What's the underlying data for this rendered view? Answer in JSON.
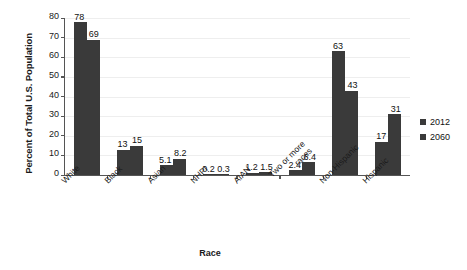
{
  "chart_data": {
    "type": "bar",
    "title": "",
    "xlabel": "Race",
    "ylabel": "Percent of Total U.S. Population",
    "ylim": [
      0,
      80
    ],
    "yticks": [
      0,
      10,
      20,
      30,
      40,
      50,
      60,
      70,
      80
    ],
    "grid": true,
    "legend_position": "right",
    "categories": [
      "White",
      "Black",
      "Asian",
      "NHPI",
      "AIAN",
      "Two or more races",
      "Non-Hispanic",
      "Hispanic"
    ],
    "series": [
      {
        "name": "2012",
        "values": [
          78,
          13,
          5.1,
          0.2,
          1.2,
          2.4,
          63,
          17
        ],
        "labels": [
          "78",
          "13",
          "5.1",
          "0.2",
          "1.2",
          "2.4",
          "63",
          "17"
        ],
        "color": "#3a3a3a"
      },
      {
        "name": "2060",
        "values": [
          69,
          15,
          8.2,
          0.3,
          1.5,
          6.4,
          43,
          31
        ],
        "labels": [
          "69",
          "15",
          "8.2",
          "0.3",
          "1.5",
          "6.4",
          "43",
          "31"
        ],
        "color": "#3a3a3a"
      }
    ]
  }
}
